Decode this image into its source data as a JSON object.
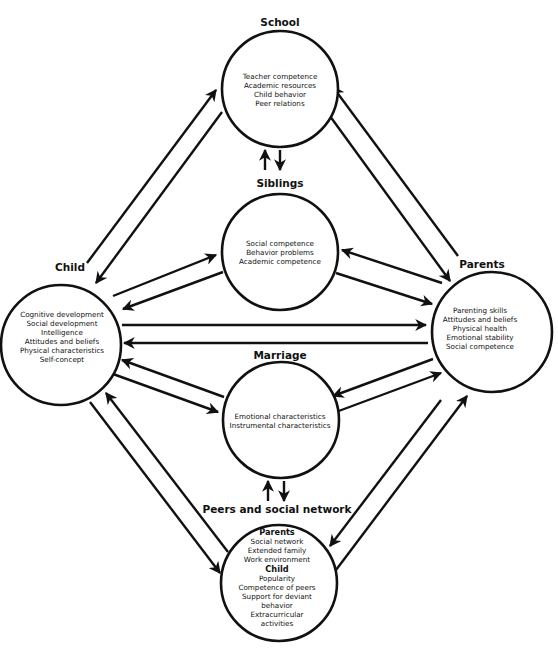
{
  "diagram": {
    "type": "family-systems-influence-model",
    "colors": {
      "stroke": "#111111",
      "background": "#ffffff"
    },
    "nodes": {
      "school": {
        "label": "School",
        "items": [
          "Teacher competence",
          "Academic resources",
          "Child behavior",
          "Peer relations"
        ]
      },
      "siblings": {
        "label": "Siblings",
        "items": [
          "Social competence",
          "Behavior problems",
          "Academic competence"
        ]
      },
      "child": {
        "label": "Child",
        "items": [
          "Cognitive development",
          "Social development",
          "Intelligence",
          "Attitudes and beliefs",
          "Physical characteristics",
          "Self-concept"
        ]
      },
      "parents": {
        "label": "Parents",
        "items": [
          "Parenting skills",
          "Attitudes and beliefs",
          "Physical health",
          "Emotional stability",
          "Social competence"
        ]
      },
      "marriage": {
        "label": "Marriage",
        "items": [
          "Emotional characteristics",
          "Instrumental characteristics"
        ]
      },
      "peers": {
        "label": "Peers and social network",
        "parents_heading": "Parents",
        "parents_items": [
          "Social network",
          "Extended family",
          "Work environment"
        ],
        "child_heading": "Child",
        "child_items": [
          "Popularity",
          "Competence of peers",
          "Support for deviant",
          "behavior",
          "Extracurricular",
          "activities"
        ]
      }
    },
    "edges": [
      {
        "from": "child",
        "to": "school"
      },
      {
        "from": "school",
        "to": "child"
      },
      {
        "from": "parents",
        "to": "school"
      },
      {
        "from": "school",
        "to": "parents"
      },
      {
        "from": "siblings",
        "to": "school"
      },
      {
        "from": "school",
        "to": "siblings"
      },
      {
        "from": "child",
        "to": "siblings"
      },
      {
        "from": "siblings",
        "to": "child"
      },
      {
        "from": "parents",
        "to": "siblings"
      },
      {
        "from": "siblings",
        "to": "parents"
      },
      {
        "from": "child",
        "to": "parents"
      },
      {
        "from": "parents",
        "to": "child"
      },
      {
        "from": "marriage",
        "to": "child"
      },
      {
        "from": "child",
        "to": "marriage"
      },
      {
        "from": "parents",
        "to": "marriage"
      },
      {
        "from": "marriage",
        "to": "parents"
      },
      {
        "from": "peers",
        "to": "marriage"
      },
      {
        "from": "marriage",
        "to": "peers"
      },
      {
        "from": "child",
        "to": "peers"
      },
      {
        "from": "peers",
        "to": "child"
      },
      {
        "from": "parents",
        "to": "peers"
      },
      {
        "from": "peers",
        "to": "parents"
      }
    ]
  }
}
